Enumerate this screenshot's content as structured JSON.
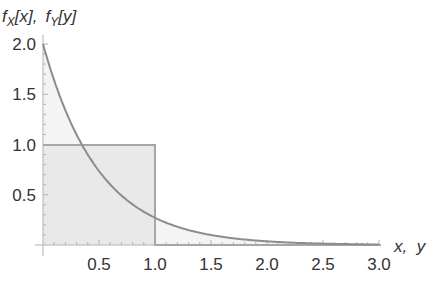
{
  "chart_data": {
    "type": "area",
    "title": "",
    "ylabel": "f_X[x],  f_Y[y]",
    "ylabel_parts": {
      "f1": "f",
      "s1": "X",
      "a1": "[x],",
      "f2": "f",
      "s2": "Y",
      "a2": "[y]"
    },
    "xlabel": "x,  y",
    "xlim": [
      0,
      3.0
    ],
    "ylim": [
      0,
      2.0
    ],
    "x_ticks": [
      "0.5",
      "1.0",
      "1.5",
      "2.0",
      "2.5",
      "3.0"
    ],
    "y_ticks": [
      "0.5",
      "1.0",
      "1.5",
      "2.0"
    ],
    "grid": false,
    "series": [
      {
        "name": "f_X[x]",
        "formula": "2*exp(-2x)",
        "x": [
          0,
          0.25,
          0.5,
          0.75,
          1.0,
          1.25,
          1.5,
          2.0,
          2.5,
          3.0
        ],
        "values": [
          2.0,
          1.21,
          0.74,
          0.45,
          0.27,
          0.16,
          0.1,
          0.04,
          0.01,
          0.005
        ],
        "color": "#8c8c8c",
        "filled": true
      },
      {
        "name": "f_Y[y]",
        "formula": "1 on [0,1], 0 otherwise",
        "x": [
          0,
          1.0,
          1.0,
          3.0
        ],
        "values": [
          1.0,
          1.0,
          0,
          0
        ],
        "color": "#a6a6a6",
        "filled": true
      }
    ],
    "colors": {
      "curve": "#8c8c8c",
      "uniform": "#a6a6a6",
      "fill": "#ebebeb",
      "axis": "#b3b3b3",
      "text": "#333333"
    }
  }
}
